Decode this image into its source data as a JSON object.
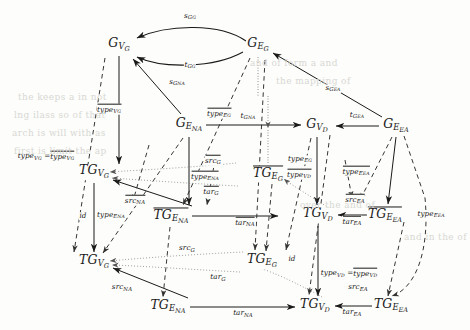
{
  "figure": {
    "kind": "commutative-diagram",
    "background": "#fdfdfb",
    "ink": "#1a1a1a"
  },
  "nodes": [
    {
      "id": "GVG_top",
      "base": "G",
      "sub": "V",
      "sub2": "G",
      "overline": false,
      "x": 119,
      "y": 45
    },
    {
      "id": "GEG_top",
      "base": "G",
      "sub": "E",
      "sub2": "G",
      "overline": false,
      "x": 258,
      "y": 45
    },
    {
      "id": "GENA",
      "base": "G",
      "sub": "E",
      "sub2": "NA",
      "overline": false,
      "x": 189,
      "y": 125
    },
    {
      "id": "GVD",
      "base": "G",
      "sub": "V",
      "sub2": "D",
      "overline": false,
      "x": 317,
      "y": 126
    },
    {
      "id": "GEEA",
      "base": "G",
      "sub": "E",
      "sub2": "EA",
      "overline": false,
      "x": 396,
      "y": 126
    },
    {
      "id": "TGVG_up",
      "base": "TG",
      "sub": "V",
      "sub2": "G",
      "overline": false,
      "x": 94,
      "y": 172
    },
    {
      "id": "TGEG_bar",
      "base": "TG",
      "sub": "E",
      "sub2": "G",
      "overline": true,
      "x": 268,
      "y": 174
    },
    {
      "id": "TGENA_bar",
      "base": "TG",
      "sub": "E",
      "sub2": "NA",
      "overline": true,
      "x": 171,
      "y": 216
    },
    {
      "id": "TGVD_up",
      "base": "TG",
      "sub": "V",
      "sub2": "D",
      "overline": false,
      "x": 318,
      "y": 215
    },
    {
      "id": "TGEEA_bar",
      "base": "TG",
      "sub": "E",
      "sub2": "EA",
      "overline": true,
      "x": 385,
      "y": 215
    },
    {
      "id": "TGVG_low",
      "base": "TG",
      "sub": "V",
      "sub2": "G",
      "overline": false,
      "x": 94,
      "y": 262
    },
    {
      "id": "TGEG_low",
      "base": "TG",
      "sub": "E",
      "sub2": "G",
      "overline": false,
      "x": 262,
      "y": 261
    },
    {
      "id": "TGENA_low",
      "base": "TG",
      "sub": "E",
      "sub2": "NA",
      "overline": false,
      "x": 168,
      "y": 307
    },
    {
      "id": "TGVD_low",
      "base": "TG",
      "sub": "V",
      "sub2": "D",
      "overline": false,
      "x": 315,
      "y": 306
    },
    {
      "id": "TGEEA_low",
      "base": "TG",
      "sub": "E",
      "sub2": "EA",
      "overline": false,
      "x": 391,
      "y": 306
    }
  ],
  "edge_labels": [
    {
      "id": "sGG",
      "text": "s",
      "sub": "G",
      "sub2": "G",
      "overline": false,
      "x": 190,
      "y": 17
    },
    {
      "id": "tGG",
      "text": "t",
      "sub": "G",
      "sub2": "G",
      "overline": false,
      "x": 190,
      "y": 66
    },
    {
      "id": "sGNA",
      "text": "s",
      "sub": "G",
      "sub2": "NA",
      "overline": false,
      "x": 177,
      "y": 83
    },
    {
      "id": "sGEA",
      "text": "s",
      "sub": "G",
      "sub2": "EA",
      "overline": false,
      "x": 333,
      "y": 89
    },
    {
      "id": "tGNA",
      "text": "t",
      "sub": "G",
      "sub2": "NA",
      "overline": false,
      "x": 248,
      "y": 117
    },
    {
      "id": "tGEA",
      "text": "t",
      "sub": "G",
      "sub2": "EA",
      "overline": false,
      "x": 357,
      "y": 116
    },
    {
      "id": "typeVG_bar_top",
      "text": "type",
      "sub": "V",
      "sub2": "G",
      "overline": true,
      "x": 109,
      "y": 109
    },
    {
      "id": "typeEG_bar",
      "text": "type",
      "sub": "E",
      "sub2": "G",
      "overline": true,
      "x": 219,
      "y": 113
    },
    {
      "id": "typeVG_eq",
      "text": "type",
      "sub": "V",
      "sub2": "G",
      "overline": false,
      "x": 46,
      "y": 156,
      "equals": true
    },
    {
      "id": "srcG_bar_up",
      "text": "src",
      "sub": "G",
      "sub2": "",
      "overline": true,
      "x": 213,
      "y": 160
    },
    {
      "id": "typeENA_bar",
      "text": "type",
      "sub": "E",
      "sub2": "NA",
      "overline": true,
      "x": 205,
      "y": 176
    },
    {
      "id": "targ_bar",
      "text": "tar",
      "sub": "G",
      "sub2": "",
      "overline": true,
      "x": 211,
      "y": 191
    },
    {
      "id": "typeEG_small",
      "text": "type",
      "sub": "E",
      "sub2": "G",
      "overline": false,
      "x": 300,
      "y": 160
    },
    {
      "id": "typeVD_bar",
      "text": "type",
      "sub": "V",
      "sub2": "D",
      "overline": true,
      "x": 299,
      "y": 174
    },
    {
      "id": "typeEEA_bar",
      "text": "type",
      "sub": "E",
      "sub2": "EA",
      "overline": true,
      "x": 356,
      "y": 171
    },
    {
      "id": "srcEA_bar",
      "text": "src",
      "sub": "EA",
      "sub2": "",
      "overline": true,
      "x": 355,
      "y": 199
    },
    {
      "id": "srcNA_bar",
      "text": "src",
      "sub": "NA",
      "sub2": "",
      "overline": true,
      "x": 135,
      "y": 200
    },
    {
      "id": "id_upper",
      "text": "id",
      "sub": "",
      "sub2": "",
      "overline": false,
      "x": 83,
      "y": 216,
      "plain": true
    },
    {
      "id": "typeENA_small",
      "text": "type",
      "sub": "E",
      "sub2": "NA",
      "overline": false,
      "x": 111,
      "y": 216
    },
    {
      "id": "tarNA_bar",
      "text": "tar",
      "sub": "NA",
      "sub2": "",
      "overline": true,
      "x": 245,
      "y": 222
    },
    {
      "id": "tarEA_bar",
      "text": "tar",
      "sub": "EA",
      "sub2": "",
      "overline": true,
      "x": 352,
      "y": 221
    },
    {
      "id": "typeEEA_right",
      "text": "type",
      "sub": "E",
      "sub2": "EA",
      "overline": false,
      "x": 431,
      "y": 215
    },
    {
      "id": "srcG_low",
      "text": "src",
      "sub": "G",
      "sub2": "",
      "overline": false,
      "x": 187,
      "y": 249
    },
    {
      "id": "id_lower",
      "text": "id",
      "sub": "",
      "sub2": "",
      "overline": false,
      "x": 292,
      "y": 259,
      "plain": true
    },
    {
      "id": "typeVD_eq",
      "text": "type",
      "sub": "V",
      "sub2": "D",
      "overline": false,
      "x": 349,
      "y": 273,
      "equals": true
    },
    {
      "id": "targ_low",
      "text": "tar",
      "sub": "G",
      "sub2": "",
      "overline": false,
      "x": 218,
      "y": 278
    },
    {
      "id": "srcNA_low",
      "text": "src",
      "sub": "NA",
      "sub2": "",
      "overline": false,
      "x": 122,
      "y": 288
    },
    {
      "id": "srcEA_low",
      "text": "src",
      "sub": "EA",
      "sub2": "",
      "overline": false,
      "x": 358,
      "y": 288
    },
    {
      "id": "tarNA_low",
      "text": "tar",
      "sub": "NA",
      "sub2": "",
      "overline": false,
      "x": 243,
      "y": 314
    },
    {
      "id": "tarEA_low",
      "text": "tar",
      "sub": "EA",
      "sub2": "",
      "overline": false,
      "x": 352,
      "y": 313
    }
  ],
  "ghost_text": [
    {
      "id": "g1",
      "text": "the keeps a   in  not",
      "x": 18,
      "y": 92
    },
    {
      "id": "g2",
      "text": "lng ilass  so  of  that",
      "x": 14,
      "y": 110
    },
    {
      "id": "g3",
      "text": "arch  is  will  with  as",
      "x": 12,
      "y": 128
    },
    {
      "id": "g4",
      "text": "first   is  limit  the  ap",
      "x": 14,
      "y": 146
    },
    {
      "id": "g5",
      "text": "and  of  form  a  and",
      "x": 250,
      "y": 58
    },
    {
      "id": "g6",
      "text": "the   mapping   of",
      "x": 276,
      "y": 76
    },
    {
      "id": "g7",
      "text": "over the   and  of",
      "x": 300,
      "y": 200
    },
    {
      "id": "g8",
      "text": "and  in   the  of",
      "x": 404,
      "y": 232
    }
  ],
  "legend": {
    "solid": "graph morphisms / structural maps",
    "dashed": "typing morphisms",
    "dotted": "source & target mappings"
  }
}
